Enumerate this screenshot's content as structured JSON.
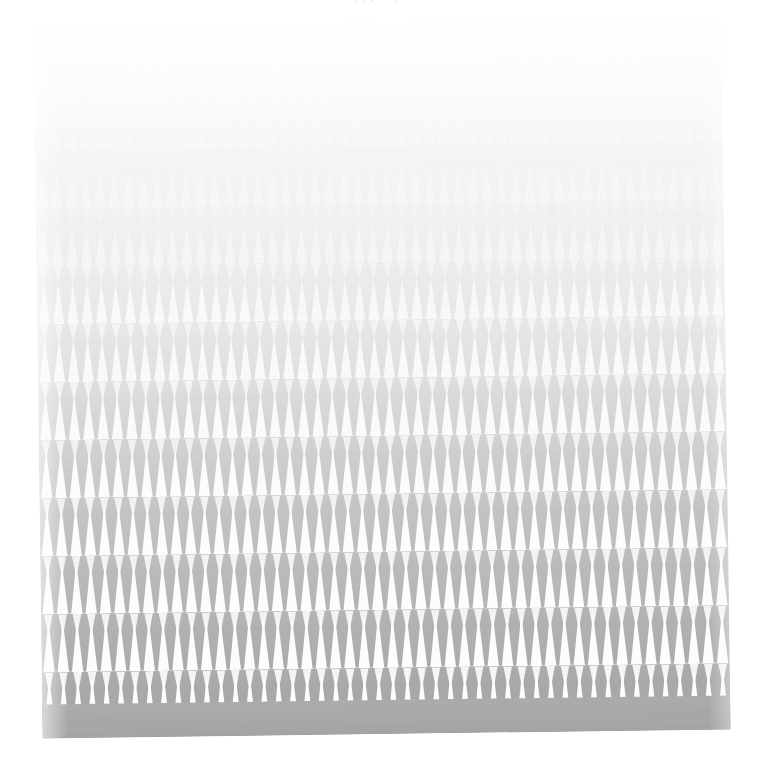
{
  "page": {
    "width": 771,
    "height": 764,
    "background_color": "#ffffff",
    "kind": "scanned-figure-plate"
  },
  "caption": {
    "visible_fragments": ". .  .  -  -  .   -  -",
    "note": "illegible faded caption clipped at top edge"
  },
  "plate": {
    "left": 38,
    "top": 22,
    "width": 688,
    "height": 712,
    "rotation_deg": -0.75,
    "top_color": "#fdfdfd",
    "bottom_color": "#a7a7a7",
    "footer_color": "#a9a9a9",
    "grain_opacity": 0.22
  },
  "chart_data": {
    "type": "area",
    "title": "",
    "subtitle": "",
    "xlabel": "",
    "ylabel": "",
    "grid": false,
    "legend": "none",
    "teeth_per_row": 48,
    "tooth_pitch_px": 14.3,
    "row_count": 12,
    "x": [
      0,
      1,
      2,
      3,
      4,
      5,
      6,
      7,
      8,
      9,
      10,
      11
    ],
    "xlim": [
      0,
      11
    ],
    "ylim": [
      0,
      1
    ],
    "series": [
      {
        "name": "band-contrast",
        "units": "normalized ink contrast",
        "values": [
          0.04,
          0.07,
          0.11,
          0.16,
          0.22,
          0.3,
          0.4,
          0.52,
          0.64,
          0.76,
          0.88,
          1.0
        ]
      },
      {
        "name": "tooth-height",
        "units": "fraction of row height",
        "values": [
          0.58,
          0.6,
          0.62,
          0.66,
          0.7,
          0.74,
          0.78,
          0.82,
          0.86,
          0.88,
          0.9,
          0.92
        ]
      }
    ],
    "rows": [
      {
        "index": 0,
        "top": 8,
        "height": 58,
        "teeth": 48,
        "tooth_height": 0.58,
        "ink": "#fbfbfb",
        "tone": "#fdfdfd"
      },
      {
        "index": 1,
        "top": 66,
        "height": 58,
        "teeth": 48,
        "tooth_height": 0.6,
        "ink": "#fafafa",
        "tone": "#fbfbfb"
      },
      {
        "index": 2,
        "top": 124,
        "height": 58,
        "teeth": 48,
        "tooth_height": 0.62,
        "ink": "#f9f9f9",
        "tone": "#f7f7f7"
      },
      {
        "index": 3,
        "top": 182,
        "height": 58,
        "teeth": 48,
        "tooth_height": 0.66,
        "ink": "#f8f8f8",
        "tone": "#f2f2f2"
      },
      {
        "index": 4,
        "top": 240,
        "height": 58,
        "teeth": 48,
        "tooth_height": 0.7,
        "ink": "#fbfbfb",
        "tone": "#ececec"
      },
      {
        "index": 5,
        "top": 298,
        "height": 58,
        "teeth": 48,
        "tooth_height": 0.74,
        "ink": "#fcfcfc",
        "tone": "#e6e6e6"
      },
      {
        "index": 6,
        "top": 356,
        "height": 58,
        "teeth": 48,
        "tooth_height": 0.78,
        "ink": "#fdfdfd",
        "tone": "#dedede"
      },
      {
        "index": 7,
        "top": 414,
        "height": 58,
        "teeth": 48,
        "tooth_height": 0.82,
        "ink": "#fefefe",
        "tone": "#d3d3d3"
      },
      {
        "index": 8,
        "top": 472,
        "height": 58,
        "teeth": 48,
        "tooth_height": 0.86,
        "ink": "#ffffff",
        "tone": "#c6c6c6"
      },
      {
        "index": 9,
        "top": 530,
        "height": 58,
        "teeth": 48,
        "tooth_height": 0.88,
        "ink": "#ffffff",
        "tone": "#bababa"
      },
      {
        "index": 10,
        "top": 588,
        "height": 58,
        "teeth": 48,
        "tooth_height": 0.9,
        "ink": "#ffffff",
        "tone": "#b1b1b1"
      },
      {
        "index": 11,
        "top": 646,
        "height": 58,
        "teeth": 48,
        "tooth_height": 0.92,
        "ink": "#ffffff",
        "tone": "#ababab"
      }
    ]
  }
}
